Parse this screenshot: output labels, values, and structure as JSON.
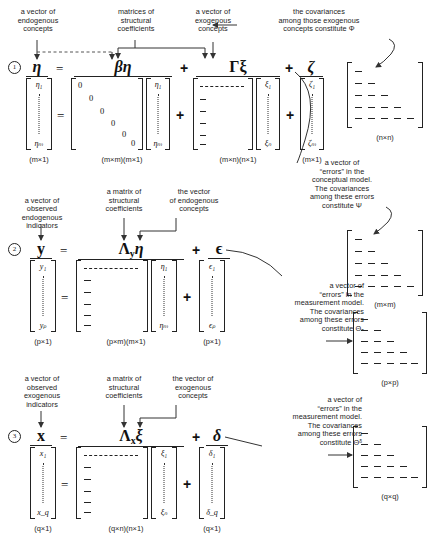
{
  "figure": {
    "bottom_caption": ""
  },
  "eq1": {
    "number": "1",
    "lhs": "η",
    "equals": "=",
    "term1": "βη",
    "plus": "+",
    "term2": "Γξ",
    "term3": "ζ",
    "lhs_top": "η₁",
    "lhs_bot": "ηₘ",
    "beta_vec_top": "η₁",
    "beta_vec_bot": "ηₘ",
    "xi_top": "ξ₁",
    "xi_bot": "ξₙ",
    "zeta_top": "ζ₁",
    "zeta_bot": "ζₘ",
    "dim_lhs": "(m×1)",
    "dim_beta": "(m×m)(m×1)",
    "dim_gamma": "(m×n)(n×1)",
    "dim_zeta": "(m×1)",
    "zeros": [
      "0",
      "0",
      "0",
      "0",
      "0",
      "0"
    ],
    "labels": {
      "endogenous": "a vector of\nendogenous\nconcepts",
      "coefficients": "matrices of\nstructural\ncoefficients",
      "exogenous": "a vector of\nexogenous\nconcepts",
      "phi_note": "the covariances\namong those exogenous\nconcepts constitute Φ",
      "zeta_note": "a vector of\n“errors” in the\nconceptual model.\nThe covariances\namong these errors\nconstitute Ψ"
    },
    "cov_phi_dim": "(n×n)",
    "cov_psi_dim": "(m×m)"
  },
  "eq2": {
    "number": "2",
    "lhs": "y",
    "equals": "=",
    "term1": "Λ",
    "term1_sub": "y",
    "term1_b": "η",
    "plus": "+",
    "term2": "ϵ",
    "lhs_top": "y₁",
    "lhs_bot": "yₚ",
    "eta_top": "η₁",
    "eta_bot": "ηₘ",
    "eps_top": "ϵ₁",
    "eps_bot": "ϵₚ",
    "dim_lhs": "(p×1)",
    "dim_lambda": "(p×m)(m×1)",
    "dim_eps": "(p×1)",
    "labels": {
      "indicators": "a vector of\nobserved\nendogenous\nindicators",
      "coefficients": "a matrix of\nstructural\ncoefficients",
      "concepts": "the vector\nof endogenous\nconcepts",
      "eps_note": "a vector of\n“errors” in the\nmeasurement model.\nThe covariances\namong these errors\nconstitute Θₑ"
    },
    "cov_theta_eps_dim": "(p×p)"
  },
  "eq3": {
    "number": "3",
    "lhs": "x",
    "equals": "=",
    "term1": "Λ",
    "term1_sub": "x",
    "term1_b": "ξ",
    "plus": "+",
    "term2": "δ",
    "lhs_top": "x₁",
    "lhs_bot": "x_q",
    "xi_top": "ξ₁",
    "xi_bot": "ξₙ",
    "delta_top": "δ₁",
    "delta_bot": "δ_q",
    "dim_lhs": "(q×1)",
    "dim_lambda": "(q×n)(n×1)",
    "dim_delta": "(q×1)",
    "labels": {
      "indicators": "a vector of\nobserved\nexogenous\nindicators",
      "coefficients": "a matrix of\nstructural\ncoefficients",
      "concepts": "the vector of\nexogenous\nconcepts",
      "delta_note": "a vector of\n“errors” in the\nmeasurement model.\nThe covariances\namong these errors\nconstitute Θᵟ"
    },
    "cov_theta_delta_dim": "(q×q)"
  }
}
